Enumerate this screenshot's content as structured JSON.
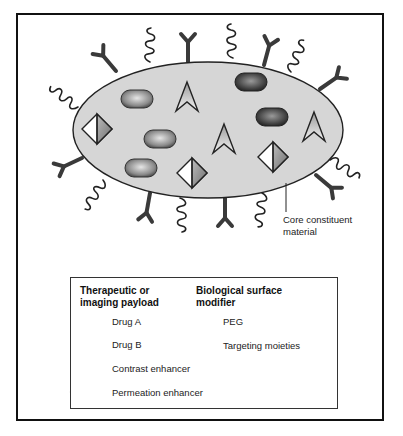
{
  "caption_fragment": "",
  "diagram": {
    "core_label": [
      "Core constituent",
      "material"
    ],
    "colors": {
      "core_fill": "#d6d6d6",
      "outline": "#222222",
      "drug_a": "#9a9a9a",
      "drug_b": "#555555",
      "diamond_shade": "#8c8c8c",
      "modifier": "#3a3a3a"
    },
    "payload_items": [
      {
        "type": "drug_a",
        "x": 137,
        "y": 99
      },
      {
        "type": "drug_b",
        "x": 251,
        "y": 82
      },
      {
        "type": "drug_b",
        "x": 272,
        "y": 117
      },
      {
        "type": "drug_a",
        "x": 160,
        "y": 139
      },
      {
        "type": "drug_a",
        "x": 141,
        "y": 168
      },
      {
        "type": "contrast_enhancer",
        "x": 97,
        "y": 129
      },
      {
        "type": "contrast_enhancer",
        "x": 192,
        "y": 173
      },
      {
        "type": "contrast_enhancer",
        "x": 273,
        "y": 157
      },
      {
        "type": "permeation_enhancer",
        "x": 187,
        "y": 98
      },
      {
        "type": "permeation_enhancer",
        "x": 224,
        "y": 140
      },
      {
        "type": "permeation_enhancer",
        "x": 314,
        "y": 128
      }
    ]
  },
  "legend": {
    "left_heading": [
      "Therapeutic or",
      "imaging payload"
    ],
    "right_heading": [
      "Biological surface",
      "modifier"
    ],
    "items": {
      "drug_a": "Drug A",
      "drug_b": "Drug B",
      "contrast": "Contrast enhancer",
      "permeation": "Permeation enhancer",
      "peg": "PEG",
      "targeting": "Targeting moieties"
    }
  }
}
